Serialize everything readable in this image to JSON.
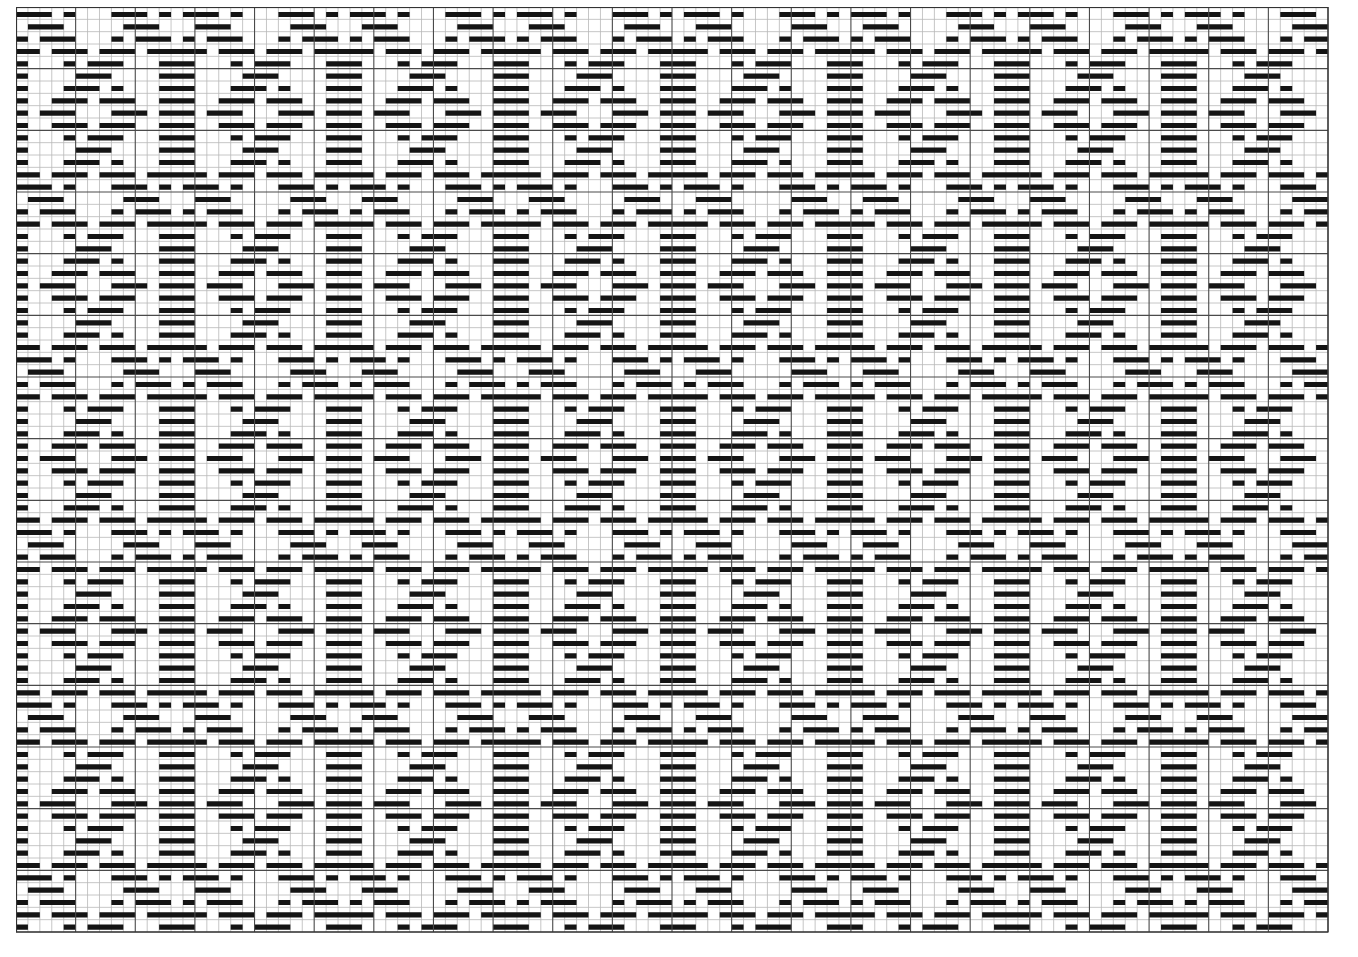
{
  "title": "Weaving draft grid",
  "grid": {
    "columns": 110,
    "rows": 75,
    "left": 16,
    "top": 7,
    "width": 1312,
    "height": 925,
    "major_every": 5,
    "bar_top_frac": 0.4,
    "bar_height_frac": 0.42
  },
  "colors": {
    "background": "#ffffff",
    "minor_line": "#b8b8b8",
    "major_line": "#4a4a4a",
    "border": "#333333",
    "filled": "#141414"
  },
  "motif": {
    "period_columns": 14,
    "period_rows": 14,
    "rows": [
      "11101000111010",
      "01110000011100",
      "10111000101110",
      "11011101110111",
      "10001011100011",
      "10000111000011",
      "10001110100011",
      "10011101110011",
      "10111000111011",
      "10011101110011",
      "10001011100011",
      "10000111000011",
      "10001110100011",
      "11011101110111"
    ]
  }
}
